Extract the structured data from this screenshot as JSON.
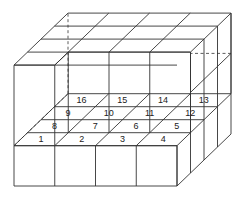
{
  "diagram": {
    "title": "",
    "grid": {
      "width": 4,
      "depth": 4,
      "height": 3
    },
    "numbered_cells": [
      {
        "label": "1",
        "row": 0,
        "col": 0
      },
      {
        "label": "2",
        "row": 0,
        "col": 1
      },
      {
        "label": "3",
        "row": 0,
        "col": 2
      },
      {
        "label": "4",
        "row": 0,
        "col": 3
      },
      {
        "label": "8",
        "row": 1,
        "col": 0
      },
      {
        "label": "7",
        "row": 1,
        "col": 1
      },
      {
        "label": "6",
        "row": 1,
        "col": 2
      },
      {
        "label": "5",
        "row": 1,
        "col": 3
      },
      {
        "label": "9",
        "row": 2,
        "col": 0
      },
      {
        "label": "10",
        "row": 2,
        "col": 1
      },
      {
        "label": "11",
        "row": 2,
        "col": 2
      },
      {
        "label": "12",
        "row": 2,
        "col": 3
      },
      {
        "label": "16",
        "row": 3,
        "col": 0
      },
      {
        "label": "15",
        "row": 3,
        "col": 1
      },
      {
        "label": "14",
        "row": 3,
        "col": 2
      },
      {
        "label": "13",
        "row": 3,
        "col": 3
      }
    ],
    "colors": {
      "line": "#333333",
      "background": "#ffffff"
    }
  }
}
